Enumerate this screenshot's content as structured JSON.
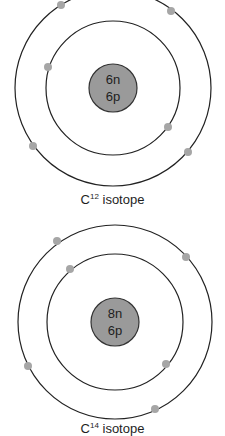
{
  "colors": {
    "background": "#ffffff",
    "orbit_stroke": "#222222",
    "nucleus_fill": "#9a9a9a",
    "nucleus_stroke": "#333333",
    "electron_fill": "#a6a6a6",
    "text": "#1e1e1e"
  },
  "atoms": [
    {
      "id": "c12",
      "element": "C",
      "mass_number": "12",
      "caption_suffix": " isotope",
      "nucleus": {
        "neutrons": "6n",
        "protons": "6p"
      },
      "geometry": {
        "cx": 113,
        "cy": 88,
        "nucleus_r": 24,
        "inner_r": 67,
        "outer_r": 98
      },
      "electrons": {
        "inner_shell": [
          [
            48,
            67
          ],
          [
            168,
            127
          ]
        ],
        "outer_shell": [
          [
            61,
            5
          ],
          [
            171,
            11
          ],
          [
            33,
            146
          ],
          [
            188,
            152
          ]
        ]
      }
    },
    {
      "id": "c14",
      "element": "C",
      "mass_number": "14",
      "caption_suffix": " isotope",
      "nucleus": {
        "neutrons": "8n",
        "protons": "6p"
      },
      "geometry": {
        "cx": 115,
        "cy": 104,
        "nucleus_r": 24,
        "inner_r": 68,
        "outer_r": 97
      },
      "electrons": {
        "inner_shell": [
          [
            70,
            51
          ],
          [
            166,
            146
          ]
        ],
        "outer_shell": [
          [
            57,
            23
          ],
          [
            186,
            39
          ],
          [
            28,
            148
          ],
          [
            155,
            191
          ]
        ]
      }
    }
  ]
}
